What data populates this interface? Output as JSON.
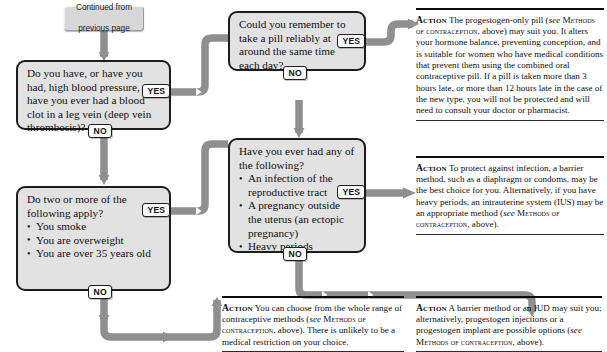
{
  "diagram": {
    "connector_color": "#8f8f8f",
    "box_fill": "#e2e2e2",
    "box_border": "#1d1d1d"
  },
  "start": {
    "line1": "Continued from",
    "line2": "previous page"
  },
  "labels": {
    "yes": "YES",
    "no": "NO"
  },
  "questions": [
    {
      "id": "q-blood-pressure",
      "text": "Do you have, or have you had, high blood pressure, or have you ever had a blood clot in a leg vein (deep vein thrombosis)?"
    },
    {
      "id": "q-risk-factors",
      "lead": "Do two or more of the following apply?",
      "bullets": [
        "You smoke",
        "You are overweight",
        "You are over 35 years old"
      ]
    },
    {
      "id": "q-pill-reliability",
      "text": "Could you remember to take a pill reliably at around the same time each day?"
    },
    {
      "id": "q-history",
      "lead": "Have you ever had any of the following?",
      "bullets": [
        "An infection of the reproductive tract",
        "A pregnancy outside the uterus (an ectopic pregnancy)",
        "Heavy periods"
      ]
    }
  ],
  "actions": [
    {
      "id": "action-progestogen-pill",
      "label": "Action",
      "text_1": " The progestogen-only pill (",
      "see_1": "see",
      "ref_1": "Methods of contraception",
      "text_2": ", above) may suit you. It alters your hormone balance, preventing conception, and is suitable for women who have medical conditions that prevent them using the combined oral contraceptive pill. If a pill is taken more than 3 hours late, or more than 12 hours late in the case of the new type, you will not be protected and will need to consult your doctor or pharmacist."
    },
    {
      "id": "action-barrier-infection",
      "label": "Action",
      "text_1": " To protect against infection, a barrier method, such as a diaphragm or condoms, may be the best choice for you. Alternatively, if you have heavy periods, an intrauterine system (IUS) may be an appropriate method (",
      "see_1": "see",
      "ref_1": "Methods of contraception",
      "text_2": ", above)."
    },
    {
      "id": "action-whole-range",
      "label": "Action",
      "text_1": " You can choose from the whole range of contraceptive methods (",
      "see_1": "see",
      "ref_1": "Methods of contraception",
      "text_2": ", above). There is unlikely to be a medical restriction on your choice."
    },
    {
      "id": "action-barrier-iud",
      "label": "Action",
      "text_1": " A barrier method or an IUD may suit you; alternatively, progestogen injections or a progestogen implant are possible options (",
      "see_1": "see",
      "ref_1": "Methods of contraception",
      "text_2": ", above)."
    }
  ]
}
